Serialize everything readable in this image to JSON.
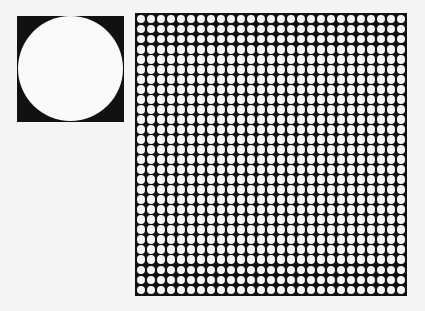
{
  "figure": {
    "single_circle": {
      "label": "single circle in square",
      "fill": "#fafafa",
      "background": "#111111"
    },
    "circle_array": {
      "rows": 28,
      "columns": 27,
      "circle_fill": "#f6f6f6",
      "background": "#111111"
    }
  }
}
